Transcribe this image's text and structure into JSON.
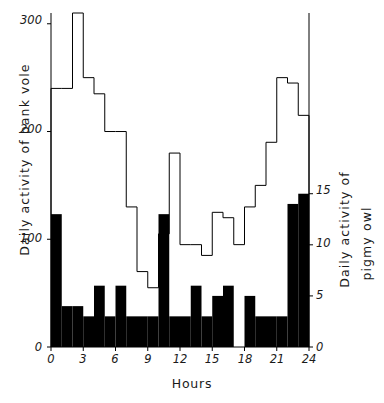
{
  "chart_data": {
    "type": "bar",
    "title": "",
    "xlabel": "Hours",
    "x": [
      0,
      1,
      2,
      3,
      4,
      5,
      6,
      7,
      8,
      9,
      10,
      11,
      12,
      13,
      14,
      15,
      16,
      17,
      18,
      19,
      20,
      21,
      22,
      23
    ],
    "xlim": [
      0,
      24
    ],
    "xticks": [
      0,
      3,
      6,
      9,
      12,
      15,
      18,
      21,
      24
    ],
    "grid": false,
    "legend": "none",
    "series": [
      {
        "name": "Daily activity of bank vole",
        "style": "step-outline",
        "color": "#000000",
        "fill": "none",
        "axis": "left",
        "ylabel": "Daily activity of bank vole",
        "ylim": [
          0,
          310
        ],
        "yticks": [
          0,
          100,
          200,
          300
        ],
        "values": [
          240,
          240,
          310,
          250,
          235,
          200,
          200,
          130,
          70,
          55,
          105,
          180,
          95,
          95,
          85,
          125,
          120,
          95,
          130,
          150,
          190,
          250,
          245,
          215
        ]
      },
      {
        "name": "Daily activity of pigmy owl",
        "style": "bar-filled",
        "color": "#000000",
        "fill": "#000000",
        "axis": "right",
        "ylabel": "Daily activity of pigmy owl",
        "ylim": [
          0,
          16
        ],
        "yticks": [
          0,
          5,
          10,
          15
        ],
        "values": [
          13,
          4,
          4,
          3,
          6,
          3,
          6,
          3,
          3,
          3,
          13,
          3,
          3,
          6,
          3,
          5,
          6,
          0,
          5,
          3,
          3,
          3,
          14,
          15
        ]
      }
    ]
  },
  "labels": {
    "xtitle": "Hours",
    "ytitle_left": "Daily activity of bank vole",
    "ytitle_right_line1": "Daily activity of",
    "ytitle_right_line2": "pigmy owl",
    "left_ticks": [
      "300",
      "200",
      "100",
      "0"
    ],
    "right_ticks": [
      "15",
      "10",
      "5",
      "0"
    ],
    "x_ticks": [
      "0",
      "3",
      "6",
      "9",
      "12",
      "15",
      "18",
      "21",
      "24"
    ]
  }
}
